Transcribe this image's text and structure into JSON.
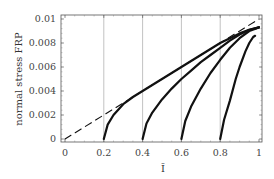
{
  "chart_data": {
    "type": "line",
    "title": "",
    "xlabel": "Ī",
    "ylabel": "normal stress FRP",
    "xlim": [
      0,
      1
    ],
    "ylim": [
      0,
      0.01
    ],
    "xticks": [
      "0",
      "0.2",
      "0.4",
      "0.6",
      "0.8",
      "1"
    ],
    "xtick_values": [
      0,
      0.2,
      0.4,
      0.6,
      0.8,
      1
    ],
    "yticks": [
      "0",
      "0.002",
      "0.004",
      "0.006",
      "0.008",
      "0.01"
    ],
    "ytick_values": [
      0,
      0.002,
      0.004,
      0.006,
      0.008,
      0.01
    ],
    "grid": "vertical lines at x = 0.2, 0.4, 0.6, 0.8",
    "legend": "none",
    "series": [
      {
        "name": "linear reference (dashed)",
        "style": "dashed",
        "x": [
          0,
          1
        ],
        "y": [
          0,
          0.01
        ]
      },
      {
        "name": "start 0.2",
        "style": "solid",
        "x": [
          0.2,
          0.22,
          0.25,
          0.3,
          0.35,
          0.4,
          0.5,
          0.6,
          0.7,
          0.8,
          0.9,
          0.95,
          1.0
        ],
        "y": [
          0,
          0.0012,
          0.002,
          0.0029,
          0.0035,
          0.004,
          0.005,
          0.006,
          0.007,
          0.008,
          0.0088,
          0.0091,
          0.0093
        ]
      },
      {
        "name": "start 0.4",
        "style": "solid",
        "x": [
          0.4,
          0.42,
          0.45,
          0.5,
          0.55,
          0.6,
          0.65,
          0.7,
          0.75,
          0.8,
          0.85,
          0.9,
          0.95,
          1.0
        ],
        "y": [
          0,
          0.0013,
          0.0022,
          0.0033,
          0.0042,
          0.005,
          0.0057,
          0.0064,
          0.007,
          0.0076,
          0.0082,
          0.0087,
          0.0091,
          0.0093
        ]
      },
      {
        "name": "start 0.6",
        "style": "solid",
        "x": [
          0.6,
          0.62,
          0.65,
          0.7,
          0.75,
          0.8,
          0.85,
          0.9,
          0.95,
          1.0
        ],
        "y": [
          0,
          0.0015,
          0.0027,
          0.0042,
          0.0055,
          0.0066,
          0.0076,
          0.0084,
          0.009,
          0.0093
        ]
      },
      {
        "name": "start 0.8",
        "style": "solid",
        "x": [
          0.8,
          0.82,
          0.85,
          0.88,
          0.9,
          0.93,
          0.95,
          0.97,
          0.98
        ],
        "y": [
          0,
          0.0016,
          0.0032,
          0.005,
          0.006,
          0.0073,
          0.008,
          0.0085,
          0.0086
        ]
      }
    ]
  }
}
